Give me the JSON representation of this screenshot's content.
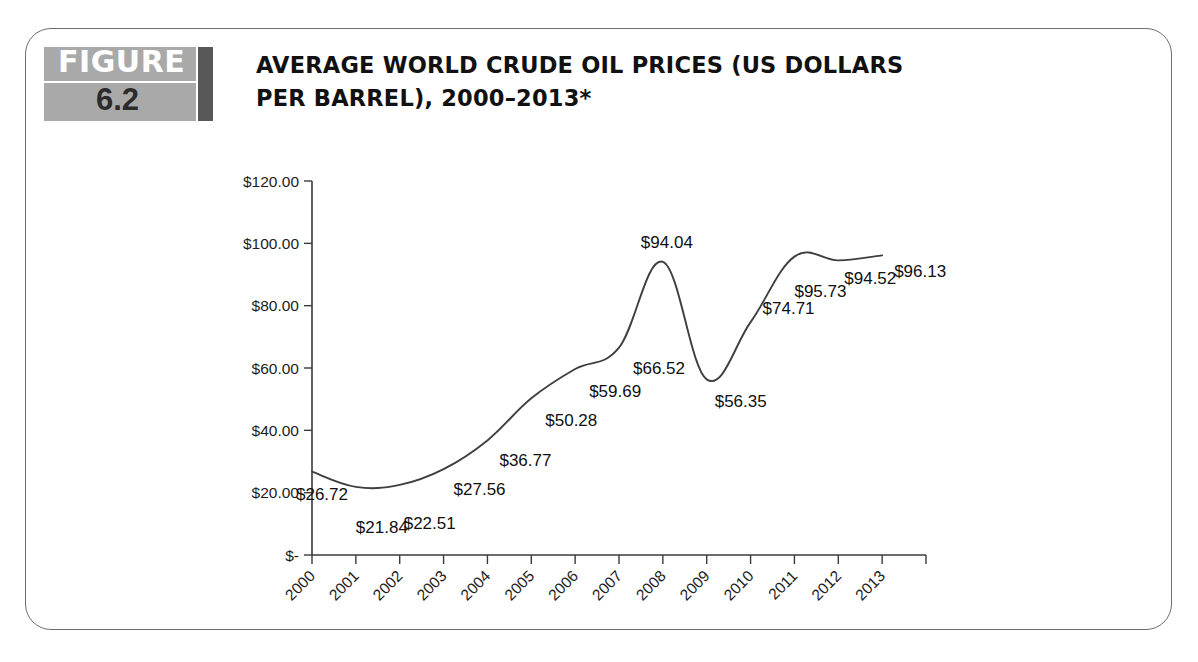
{
  "figure": {
    "badge_word": "FIGURE",
    "badge_number": "6.2",
    "title": "AVERAGE WORLD CRUDE OIL PRICES (US DOLLARS PER BARREL), 2000–2013*"
  },
  "colors": {
    "badge_grey": "#a9a9a9",
    "badge_bar": "#58585a",
    "frame_border": "#6e6e6e",
    "line": "#3f3f3f",
    "axis": "#3a3a3a",
    "text": "#111111"
  },
  "chart_data": {
    "type": "line",
    "title": "AVERAGE WORLD CRUDE OIL PRICES (US DOLLARS PER BARREL), 2000–2013*",
    "xlabel": "",
    "ylabel": "",
    "categories": [
      "2000",
      "2001",
      "2002",
      "2003",
      "2004",
      "2005",
      "2006",
      "2007",
      "2008",
      "2009",
      "2010",
      "2011",
      "2012",
      "2013"
    ],
    "values": [
      26.72,
      21.84,
      22.51,
      27.56,
      36.77,
      50.28,
      59.69,
      66.52,
      94.04,
      56.35,
      74.71,
      95.73,
      94.52,
      96.13
    ],
    "point_labels": [
      "$26.72",
      "$21.84",
      "$22.51",
      "$27.56",
      "$36.77",
      "$50.28",
      "$59.69",
      "$66.52",
      "$94.04",
      "$56.35",
      "$74.71",
      "$95.73",
      "$94.52",
      "$96.13"
    ],
    "ylim": [
      0,
      120
    ],
    "yticks": [
      0,
      20,
      40,
      60,
      80,
      100,
      120
    ],
    "ytick_labels": [
      "$-",
      "$20.00",
      "$40.00",
      "$60.00",
      "$80.00",
      "$100.00",
      "$120.00"
    ],
    "grid": false,
    "legend": false,
    "series": [
      {
        "name": "Average world crude oil price",
        "values": [
          26.72,
          21.84,
          22.51,
          27.56,
          36.77,
          50.28,
          59.69,
          66.52,
          94.04,
          56.35,
          74.71,
          95.73,
          94.52,
          96.13
        ]
      }
    ]
  }
}
